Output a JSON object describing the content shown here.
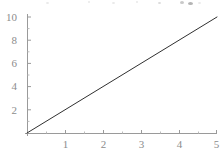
{
  "chart_data": {
    "type": "line",
    "title": "",
    "subtitle": "",
    "xlabel": "",
    "ylabel": "",
    "grid": false,
    "legend": null,
    "legend_position": "none",
    "xlim": [
      0,
      5
    ],
    "ylim": [
      0,
      10
    ],
    "xticks": [
      1,
      2,
      3,
      4,
      5
    ],
    "yticks": [
      2,
      4,
      6,
      8,
      10
    ],
    "xtick_labels": [
      "1",
      "2",
      "3",
      "4",
      "5"
    ],
    "ytick_labels": [
      "2",
      "4",
      "6",
      "8",
      "10"
    ],
    "series": [
      {
        "name": "",
        "x": [
          0,
          0.5,
          1,
          1.5,
          2,
          2.5,
          3,
          3.5,
          4,
          4.5,
          5
        ],
        "values": [
          0,
          1,
          2,
          3,
          4,
          5,
          6,
          7,
          8,
          9,
          10
        ]
      }
    ],
    "colors": {
      "line": "#303030",
      "axis": "#9a9a9a",
      "tick_text": "#8c8c8c",
      "background": "#ffffff"
    }
  },
  "geometry": {
    "origin_x": 27,
    "origin_y": 133,
    "x_unit_px": 38,
    "y_unit_px": 11.6,
    "axis_x_end": 217,
    "axis_y_top": 14
  }
}
